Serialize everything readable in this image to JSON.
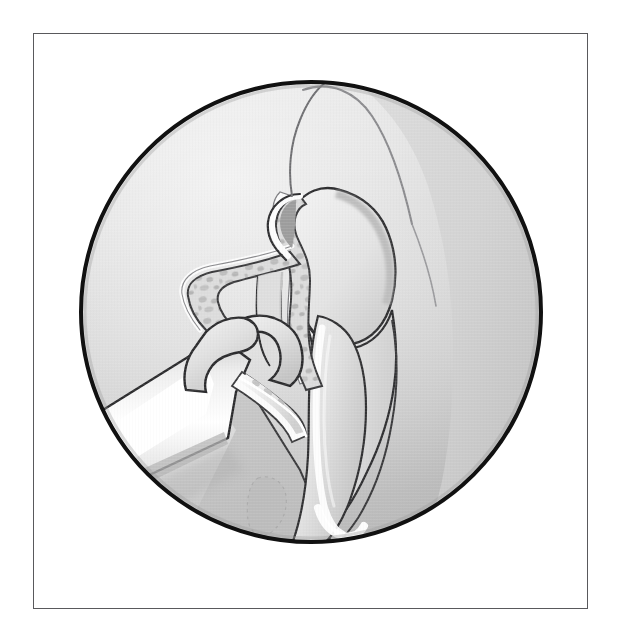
{
  "document": {
    "title": "Endoscopic view of left nasal cavity during uncinectomy",
    "medium": "grayscale line-and-tone medical illustration",
    "frame": {
      "border_color": "#59595c",
      "background_color": "#ffffff"
    }
  },
  "viewport": {
    "name": "endoscope-circular-field",
    "shape": "circle",
    "center_x": 311,
    "center_y": 312,
    "radius": 230,
    "rim_color": "#111111",
    "rim_width": 4,
    "fill_light": "#e9e9e9",
    "fill_mid": "#cfcfcf",
    "fill_dark": "#b4b4b4"
  },
  "palette": {
    "outline": "#2b2b2d",
    "outline_soft": "#6d6d70",
    "mucosa_light": "#e4e4e4",
    "mucosa_mid": "#d2d2d2",
    "mucosa_shadow": "#b9b9b9",
    "bone_fill": "#d9d9d9",
    "bone_stipple": "#b6b6b6",
    "bone_rind": "#f6f6f6",
    "instrument_body": "#dadada",
    "instrument_highlight": "#ffffff",
    "instrument_shadow": "#a9a9a9",
    "blood_spot": "#bcbcbc"
  },
  "anatomy": {
    "structures": [
      {
        "id": "middle-turbinate",
        "label": "Middle turbinate",
        "position": "center-right, vertical bulbous body",
        "tone": "mucosa_light"
      },
      {
        "id": "uncinate-process",
        "label": "Uncinate process",
        "position": "center, angled bony strip with cancellous stipple",
        "tone": "bone_fill"
      },
      {
        "id": "ethmoid-bulla",
        "label": "Ethmoid bulla",
        "position": "upper-center rounded lobe",
        "tone": "mucosa_light"
      },
      {
        "id": "lateral-nasal-wall",
        "label": "Lateral nasal wall",
        "position": "upper-right sweeping contour",
        "tone": "mucosa_mid"
      },
      {
        "id": "inferior-turbinate",
        "label": "Inferior turbinate",
        "position": "lower-center elongated body with crest highlight",
        "tone": "mucosa_light"
      },
      {
        "id": "nasal-floor-shadow",
        "label": "Nasal floor shadow",
        "position": "lower-left wedge",
        "tone": "mucosa_shadow"
      },
      {
        "id": "mucosal-blood-spot",
        "label": "Mucosal blood spot",
        "position": "lower-left of field, small oval",
        "tone": "blood_spot"
      }
    ]
  },
  "instrument": {
    "id": "backbiting-forceps",
    "label": "Backbiting (retrograde) forceps",
    "entry": "lower-left of the endoscopic field",
    "parts": [
      {
        "id": "shaft",
        "label": "Shaft",
        "tone": "instrument_body"
      },
      {
        "id": "shaft-highlight",
        "label": "Shaft specular highlight",
        "tone": "instrument_highlight"
      },
      {
        "id": "jaw-upper",
        "label": "Upper jaw",
        "tone": "instrument_body"
      },
      {
        "id": "jaw-lower-cutting",
        "label": "Lower cutting jaw",
        "tone": "instrument_body"
      },
      {
        "id": "bone-chip",
        "label": "Resected bone chip in jaws",
        "tone": "bone_fill"
      }
    ]
  },
  "labels": {
    "figure_caption": "",
    "annotations": []
  }
}
